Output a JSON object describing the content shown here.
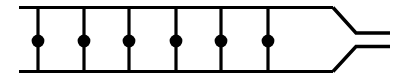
{
  "figure": {
    "type": "line-diagram",
    "canvas": {
      "width": 408,
      "height": 84,
      "background": "#ffffff"
    },
    "stroke_color": "#000000",
    "rail_stroke_width": 3.2,
    "rung_stroke_width": 3.2,
    "lead_stroke_width": 3.4,
    "node_color": "#000000",
    "node_radius": 6.4
  },
  "rails": {
    "x_start": 19,
    "x_end": 333,
    "top_y": 7.5,
    "bottom_y": 71.5,
    "top_label": "top-rail",
    "bottom_label": "bottom-rail"
  },
  "rungs": {
    "count": 6,
    "y_top": 7.5,
    "y_bottom": 71.5,
    "x_positions": [
      38,
      84,
      129,
      176,
      221,
      268
    ]
  },
  "nodes": {
    "count": 6,
    "center_y": 41,
    "radius": 6.4,
    "x_positions": [
      38,
      84,
      129,
      176,
      221,
      268
    ]
  },
  "taper": {
    "start_x": 333,
    "bend_x": 356,
    "end_x": 390,
    "upper_start_y": 7.5,
    "upper_end_y": 33,
    "lower_start_y": 71.5,
    "lower_end_y": 46.5
  },
  "output_leads": {
    "upper": {
      "x_start": 356,
      "x_end": 390,
      "y": 33
    },
    "lower": {
      "x_start": 356,
      "x_end": 390,
      "y": 46.5
    }
  }
}
